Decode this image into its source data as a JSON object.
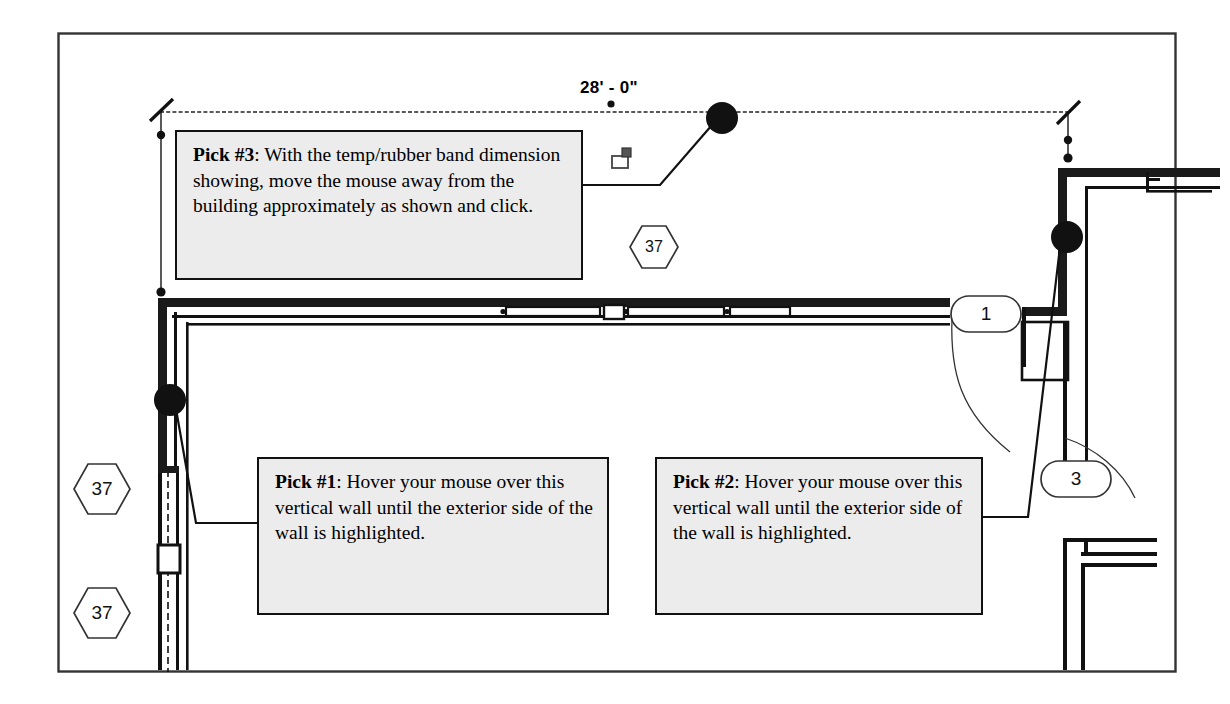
{
  "figure": {
    "type": "architectural-floor-plan-tutorial",
    "border": {
      "color": "#333333"
    }
  },
  "dimension": {
    "label": "28' - 0\"",
    "cursor_icon": "dimension-cursor-icon"
  },
  "callouts": [
    {
      "id": "pick-3",
      "lead": "Pick #3",
      "text": ": With the temp/rubber band dimension showing, move the mouse away from the building approximately as shown and click."
    },
    {
      "id": "pick-1",
      "lead": "Pick #1",
      "text": ": Hover your mouse over this vertical wall until the exterior side of the wall is highlighted."
    },
    {
      "id": "pick-2",
      "lead": "Pick #2",
      "text": ": Hover your mouse over this vertical wall until the exterior side of the wall is highlighted."
    }
  ],
  "tags": {
    "hex": [
      {
        "id": "hex-tag-center",
        "value": "37"
      },
      {
        "id": "hex-tag-left-upper",
        "value": "37"
      },
      {
        "id": "hex-tag-left-lower",
        "value": "37"
      }
    ],
    "oval": [
      {
        "id": "oval-tag-1",
        "value": "1"
      },
      {
        "id": "oval-tag-3",
        "value": "3"
      }
    ]
  },
  "pick_markers": [
    {
      "id": "pick-marker-3",
      "x": 722,
      "y": 118
    },
    {
      "id": "pick-marker-1",
      "x": 170,
      "y": 400
    },
    {
      "id": "pick-marker-2",
      "x": 1067,
      "y": 237
    }
  ],
  "colors": {
    "wall_fill": "#1a1a1a",
    "wall_line": "#111111",
    "callout_bg": "#ececec",
    "frame": "#333333",
    "dim_line": "#222222"
  }
}
